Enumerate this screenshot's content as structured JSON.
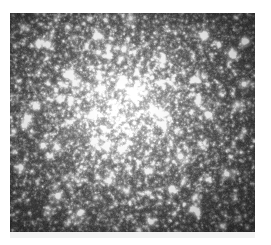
{
  "figure": {
    "kind": "astronomical-image",
    "colorspace": "grayscale",
    "page_background": "#ffffff",
    "plate": {
      "x": 10,
      "y": 13,
      "width": 245,
      "height": 219,
      "background_dark": "#242424",
      "star_color_bright": "#ffffff",
      "star_color_mid": "#cfcfcf",
      "halo_color": "#8a8a8a"
    },
    "underband": {
      "x": 10,
      "y": 232,
      "width": 245,
      "height": 6,
      "color": "#f2f2f2"
    },
    "core": {
      "center_x_frac": 0.46,
      "center_y_frac": 0.44,
      "radius_frac": 0.52,
      "peak_brightness": 0.55
    },
    "noise": {
      "seed": 20240917,
      "grain_amplitude": 0.17,
      "base_level": 0.13
    },
    "stars": {
      "faint_count": 11000,
      "mid_count": 1600,
      "bright_count": 150,
      "brightest_count": 26,
      "faint_radius_px": [
        0.4,
        1.0
      ],
      "mid_radius_px": [
        0.9,
        1.7
      ],
      "bright_radius_px": [
        1.5,
        2.6
      ],
      "brightest_radius_px": [
        2.3,
        3.6
      ]
    },
    "notable_stars": [
      {
        "x_frac": 0.155,
        "y_frac": 0.145,
        "brightness": 0.95
      },
      {
        "x_frac": 0.355,
        "y_frac": 0.105,
        "brightness": 0.88
      },
      {
        "x_frac": 0.795,
        "y_frac": 0.095,
        "brightness": 0.9
      },
      {
        "x_frac": 0.905,
        "y_frac": 0.185,
        "brightness": 0.97
      },
      {
        "x_frac": 0.245,
        "y_frac": 0.275,
        "brightness": 0.93
      },
      {
        "x_frac": 0.105,
        "y_frac": 0.425,
        "brightness": 1.0
      },
      {
        "x_frac": 0.072,
        "y_frac": 0.485,
        "brightness": 0.92
      },
      {
        "x_frac": 0.372,
        "y_frac": 0.345,
        "brightness": 0.9
      },
      {
        "x_frac": 0.505,
        "y_frac": 0.385,
        "brightness": 0.86
      },
      {
        "x_frac": 0.585,
        "y_frac": 0.445,
        "brightness": 0.91
      },
      {
        "x_frac": 0.345,
        "y_frac": 0.585,
        "brightness": 0.94
      },
      {
        "x_frac": 0.455,
        "y_frac": 0.625,
        "brightness": 0.89
      },
      {
        "x_frac": 0.695,
        "y_frac": 0.655,
        "brightness": 0.96
      },
      {
        "x_frac": 0.885,
        "y_frac": 0.735,
        "brightness": 0.9
      },
      {
        "x_frac": 0.195,
        "y_frac": 0.835,
        "brightness": 0.98
      },
      {
        "x_frac": 0.285,
        "y_frac": 0.915,
        "brightness": 0.95
      },
      {
        "x_frac": 0.575,
        "y_frac": 0.955,
        "brightness": 0.87
      },
      {
        "x_frac": 0.745,
        "y_frac": 0.895,
        "brightness": 0.88
      },
      {
        "x_frac": 0.955,
        "y_frac": 0.325,
        "brightness": 0.85
      },
      {
        "x_frac": 0.045,
        "y_frac": 0.705,
        "brightness": 0.84
      },
      {
        "x_frac": 0.625,
        "y_frac": 0.215,
        "brightness": 0.83
      },
      {
        "x_frac": 0.465,
        "y_frac": 0.165,
        "brightness": 0.82
      },
      {
        "x_frac": 0.815,
        "y_frac": 0.465,
        "brightness": 0.86
      },
      {
        "x_frac": 0.135,
        "y_frac": 0.605,
        "brightness": 0.85
      },
      {
        "x_frac": 0.405,
        "y_frac": 0.765,
        "brightness": 0.84
      },
      {
        "x_frac": 0.665,
        "y_frac": 0.805,
        "brightness": 0.83
      }
    ],
    "labels": {
      "title": "",
      "caption": ""
    }
  }
}
